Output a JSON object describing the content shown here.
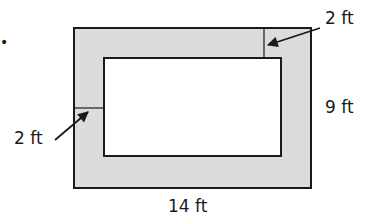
{
  "diagram": {
    "bullet": "•",
    "labels": {
      "top_right_width": "2 ft",
      "left_width": "2 ft",
      "height": "9 ft",
      "length": "14 ft"
    },
    "colors": {
      "border_fill": "#dcdcdc",
      "inner_fill": "#ffffff",
      "stroke": "#1a1a1a"
    }
  }
}
